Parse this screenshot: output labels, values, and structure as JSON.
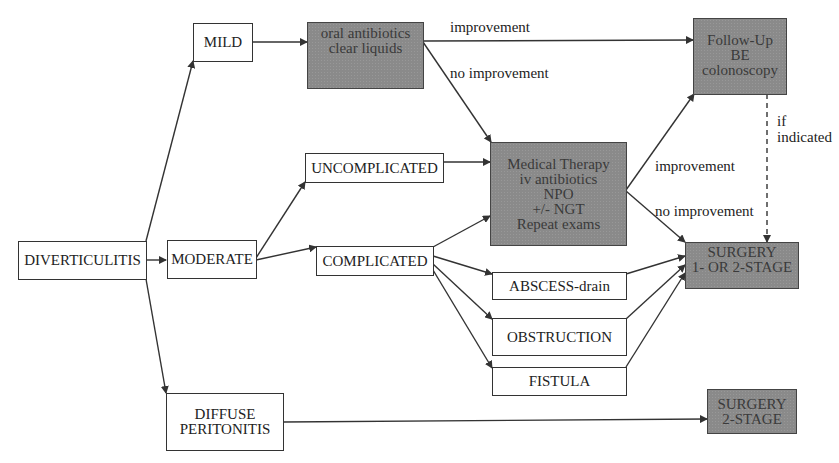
{
  "diagram": {
    "nodes": {
      "diverticulitis": "DIVERTICULITIS",
      "mild": "MILD",
      "moderate": "MODERATE",
      "diffuse_peritonitis": "DIFFUSE\nPERITONITIS",
      "oral_antibiotics": "oral antibiotics\nclear liquids",
      "uncomplicated": "UNCOMPLICATED",
      "complicated": "COMPLICATED",
      "medical_therapy": "Medical Therapy\niv antibiotics\nNPO\n+/- NGT\nRepeat exams",
      "follow_up": "Follow-Up\nBE\ncolonoscopy",
      "surgery_1_or_2": "SURGERY\n1- OR 2-STAGE",
      "abscess": "ABSCESS-drain",
      "obstruction": "OBSTRUCTION",
      "fistula": "FISTULA",
      "surgery_2_stage": "SURGERY\n2-STAGE"
    },
    "edge_labels": {
      "oral_improvement": "improvement",
      "oral_no_improvement": "no improvement",
      "medical_improvement": "improvement",
      "medical_no_improvement": "no improvement",
      "if_indicated": "if\nindicated"
    },
    "colors": {
      "shaded_box": "#8a8a8a",
      "line": "#333333",
      "background": "#ffffff"
    }
  }
}
